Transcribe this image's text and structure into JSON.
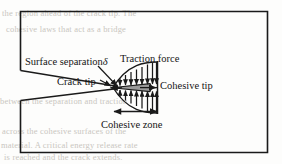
{
  "figure": {
    "width": 282,
    "height": 164,
    "background_color": "#fdfdfc",
    "line_color": "#1a1a1a",
    "wedge_fill_color": "#9a9a9a",
    "ghost_text_color": "#c9c6c0"
  },
  "labels": {
    "surface_separation": "Surface separation",
    "surface_separation_symbol": "δ",
    "traction_force": "Traction force",
    "crack_tip": "Crack tip",
    "cohesive_tip": "Cohesive tip",
    "cohesive_zone": "Cohesive zone"
  },
  "annotations": {
    "traction_arrow_count": 8,
    "dimension_arrow": "double-headed",
    "crack_mouth_side": "left"
  },
  "background_text": {
    "lines": [
      "the region ahead of the crack tip. The",
      "cohesive laws that act as a bridge",
      "between the separation and traction",
      "across the cohesive surfaces of the",
      "material. A critical energy release rate",
      "is reached and the crack extends."
    ]
  }
}
